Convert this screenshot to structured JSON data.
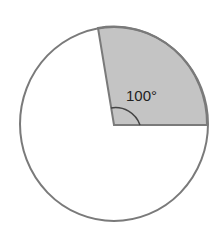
{
  "diagram": {
    "type": "circle-sector",
    "angle_label": "100°",
    "angle_degrees": 100,
    "colors": {
      "outline": "#7a7a7a",
      "sector_fill": "#c4c4c4",
      "background": "#ffffff"
    }
  }
}
